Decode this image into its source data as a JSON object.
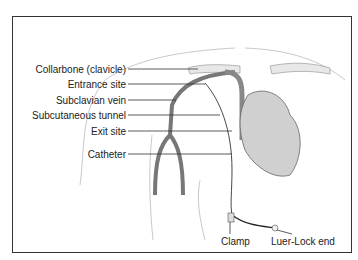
{
  "figure": {
    "labels_left": [
      {
        "text": "Collarbone (clavicle)",
        "y": 69
      },
      {
        "text": "Entrance site",
        "y": 84
      },
      {
        "text": "Subclavian vein",
        "y": 100
      },
      {
        "text": "Subcutaneous tunnel",
        "y": 115
      },
      {
        "text": "Exit site",
        "y": 131
      },
      {
        "text": "Catheter",
        "y": 154
      }
    ],
    "labels_bottom": [
      {
        "text": "Clamp"
      },
      {
        "text": "Luer-Lock end"
      }
    ],
    "colors": {
      "border": "#333333",
      "vein": "#777777",
      "outline": "#aaaaaa",
      "bone": "#e8e8e8",
      "heart": "#d0d0d0"
    }
  }
}
